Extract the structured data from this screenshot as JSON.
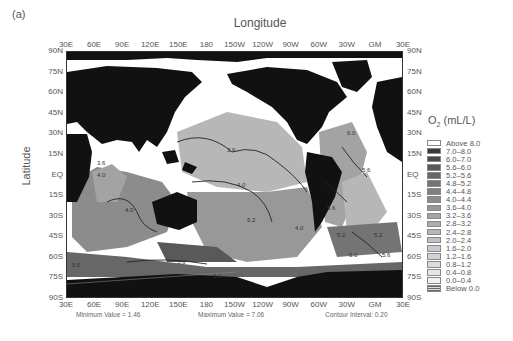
{
  "figure": {
    "panel_label": "(a)",
    "x_axis_title": "Longitude",
    "y_axis_title": "Latitude",
    "x_ticks": [
      "30E",
      "60E",
      "90E",
      "120E",
      "150E",
      "180",
      "150W",
      "120W",
      "90W",
      "60W",
      "30W",
      "GM",
      "30E"
    ],
    "y_ticks": [
      "90N",
      "75N",
      "60N",
      "45N",
      "30N",
      "15N",
      "EQ",
      "15S",
      "30S",
      "45S",
      "60S",
      "75S",
      "90S"
    ],
    "legend_title_main": "O",
    "legend_title_sub": "2",
    "legend_title_unit": " (mL/L)",
    "legend": [
      {
        "label": "Above  8.0",
        "color": "#ffffff"
      },
      {
        "label": "7.0–8.0",
        "color": "#3a3a3a"
      },
      {
        "label": "6.0–7.0",
        "color": "#4a4a4a"
      },
      {
        "label": "5.6–6.0",
        "color": "#595959"
      },
      {
        "label": "5.2–5.6",
        "color": "#676767"
      },
      {
        "label": "4.8–5.2",
        "color": "#747474"
      },
      {
        "label": "4.4–4.8",
        "color": "#808080"
      },
      {
        "label": "4.0–4.4",
        "color": "#8c8c8c"
      },
      {
        "label": "3.6–4.0",
        "color": "#989898"
      },
      {
        "label": "3.2–3.6",
        "color": "#a3a3a3"
      },
      {
        "label": "2.8–3.2",
        "color": "#adadad"
      },
      {
        "label": "2.4–2.8",
        "color": "#b7b7b7"
      },
      {
        "label": "2.0–2.4",
        "color": "#c1c1c1"
      },
      {
        "label": "1.6–2.0",
        "color": "#cacaca"
      },
      {
        "label": "1.2–1.6",
        "color": "#d3d3d3"
      },
      {
        "label": "0.8–1.2",
        "color": "#dcdcdc"
      },
      {
        "label": "0.4–0.8",
        "color": "#e6e6e6"
      },
      {
        "label": "0.0–0.4",
        "color": "#f0f0f0"
      },
      {
        "label": "Below 0.0",
        "color": "hatch"
      }
    ],
    "minimum_value_text": "Minimum Value = 1.46",
    "maximum_value_text": "Maximum Value = 7.06",
    "contour_interval_text": "Contour Interval: 0.20",
    "contour_labels": [
      "3.6",
      "4.0",
      "5.2",
      "5.6",
      "6.0",
      "5.6",
      "3.6",
      "4.0",
      "5.2",
      "5.6",
      "5.2",
      "4.0",
      "5.2",
      "6.0",
      "5.6",
      "5.2",
      "5.6"
    ],
    "colors": {
      "land": "#111111",
      "missing": "#ffffff",
      "frame": "#333333"
    }
  }
}
